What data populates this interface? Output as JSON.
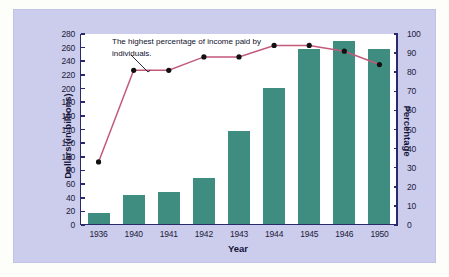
{
  "chart_data": {
    "type": "bar",
    "title": "",
    "xlabel": "Year",
    "ylabel": "Dollars (in billions)",
    "y2label": "Percentage",
    "categories": [
      "1936",
      "1940",
      "1941",
      "1942",
      "1943",
      "1944",
      "1945",
      "1946",
      "1950"
    ],
    "ylim": [
      0,
      280
    ],
    "yticks": [
      0,
      20,
      40,
      60,
      80,
      100,
      120,
      140,
      160,
      180,
      200,
      220,
      240,
      260,
      280
    ],
    "y2lim": [
      0,
      100
    ],
    "y2ticks": [
      0,
      10,
      20,
      30,
      40,
      50,
      60,
      70,
      80,
      90,
      100
    ],
    "grid": false,
    "legend": "none",
    "series": [
      {
        "name": "Dollars (in billions)",
        "type": "bar",
        "axis": "left",
        "color": "#3f8c80",
        "values": [
          16,
          43,
          47,
          68,
          136,
          200,
          257,
          268,
          256
        ]
      },
      {
        "name": "Percentage",
        "type": "line",
        "axis": "right",
        "color": "#c25a7a",
        "marker_color": "#111111",
        "values": [
          33,
          81,
          81,
          88,
          88,
          94,
          94,
          91,
          84
        ]
      }
    ],
    "annotations": [
      {
        "text": "The highest percentage of income paid by individuals.",
        "target_category": "1940-1941",
        "target_value": 81
      }
    ]
  },
  "colors": {
    "panel_background": "#ccccec",
    "plot_background": "#ffffff",
    "axis": "#2a2a6a",
    "bar": "#3f8c80",
    "line": "#c25a7a",
    "marker": "#111111",
    "text": "#14143a"
  }
}
